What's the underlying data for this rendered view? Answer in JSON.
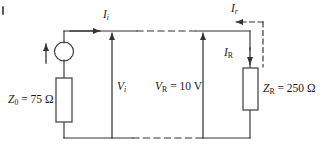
{
  "diagram": {
    "type": "electrical-circuit",
    "stroke_color": "#333333",
    "background_color": "#ffffff",
    "labels": {
      "source_impedance": {
        "symbol": "Z",
        "sub": "0",
        "value": "75",
        "unit": "Ω",
        "text": "Z0 = 75 Ω"
      },
      "load_impedance": {
        "symbol": "Z",
        "sub": "R",
        "value": "250",
        "unit": "Ω",
        "text": "ZR = 250 Ω"
      },
      "incident_voltage": {
        "symbol": "V",
        "sub": "i",
        "text": "Vi"
      },
      "load_voltage": {
        "symbol": "V",
        "sub": "R",
        "value": "10",
        "unit": "V",
        "text": "VR = 10 V"
      },
      "incident_current": {
        "symbol": "I",
        "sub": "i",
        "text": "Ii"
      },
      "reflected_current": {
        "symbol": "I",
        "sub": "r",
        "text": "Ir"
      },
      "load_current": {
        "symbol": "I",
        "sub": "R",
        "text": "IR"
      }
    },
    "components": [
      {
        "name": "source",
        "kind": "circle-source"
      },
      {
        "name": "source-resistor",
        "kind": "resistor-box"
      },
      {
        "name": "load-resistor",
        "kind": "resistor-box"
      }
    ],
    "arrows": [
      {
        "name": "incident-current-arrow",
        "direction": "right"
      },
      {
        "name": "reflected-current-arrow",
        "direction": "left",
        "style": "dashed"
      },
      {
        "name": "load-current-arrow",
        "direction": "down"
      },
      {
        "name": "incident-voltage-arrow",
        "direction": "up"
      },
      {
        "name": "load-voltage-arrow",
        "direction": "up"
      },
      {
        "name": "source-arrow",
        "direction": "up"
      }
    ]
  }
}
